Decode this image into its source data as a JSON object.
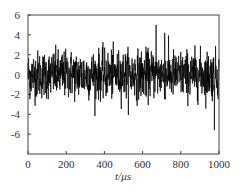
{
  "chart_data": {
    "type": "line",
    "title": "",
    "xlabel": "t/μs",
    "ylabel": "",
    "xlim": [
      0,
      1000
    ],
    "ylim": [
      -8,
      6
    ],
    "xticks": [
      0,
      200,
      400,
      600,
      800,
      1000
    ],
    "yticks": [
      6,
      4,
      2,
      0,
      -2,
      -4,
      -6
    ],
    "xtick_labels": [
      "0",
      "200",
      "400",
      "600",
      "800",
      "1000"
    ],
    "ytick_labels": [
      "6",
      "4",
      "2",
      "0",
      "-2",
      "-4",
      "-6"
    ],
    "grid": false,
    "legend": null,
    "series": [
      {
        "name": "signal",
        "description": "dense random noise signal centered at 0, typical amplitude about ±2.5, occasional peaks up to about +5 and troughs to about -5.5",
        "color": "#000000",
        "n_points": 1000,
        "mean": 0,
        "std": 1.2,
        "max": 5.0,
        "min": -5.6
      }
    ]
  },
  "labels": {
    "x_axis": "t/μs"
  }
}
